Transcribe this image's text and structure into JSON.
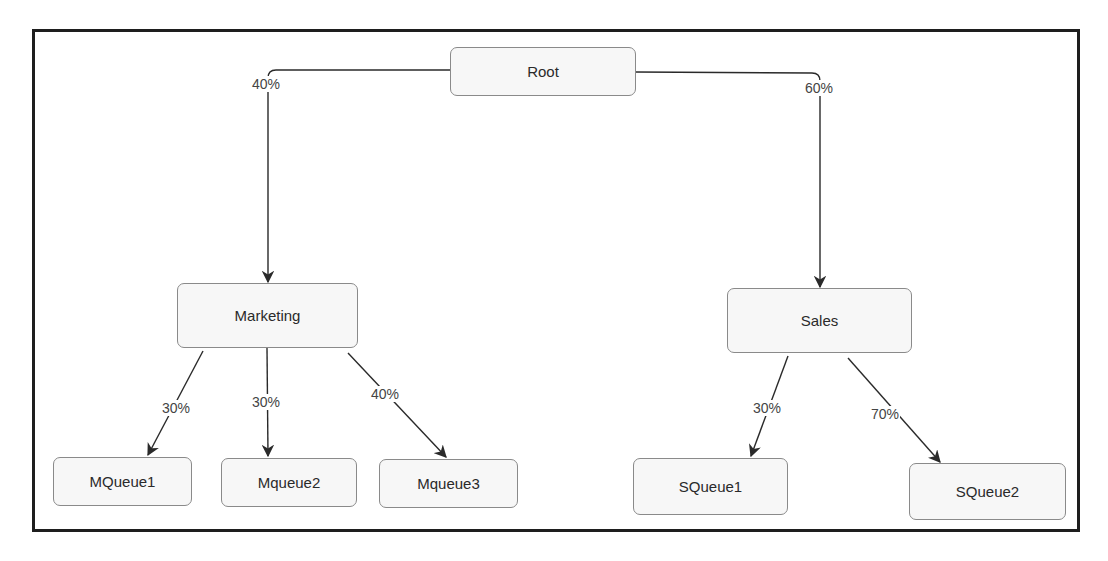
{
  "diagram": {
    "type": "tree",
    "title": "",
    "nodes": {
      "root": {
        "label": "Root"
      },
      "marketing": {
        "label": "Marketing"
      },
      "sales": {
        "label": "Sales"
      },
      "mqueue1": {
        "label": "MQueue1"
      },
      "mqueue2": {
        "label": "Mqueue2"
      },
      "mqueue3": {
        "label": "Mqueue3"
      },
      "squeue1": {
        "label": "SQueue1"
      },
      "squeue2": {
        "label": "SQueue2"
      }
    },
    "edges": {
      "root_marketing": {
        "from": "Root",
        "to": "Marketing",
        "label": "40%"
      },
      "root_sales": {
        "from": "Root",
        "to": "Sales",
        "label": "60%"
      },
      "marketing_mqueue1": {
        "from": "Marketing",
        "to": "MQueue1",
        "label": "30%"
      },
      "marketing_mqueue2": {
        "from": "Marketing",
        "to": "Mqueue2",
        "label": "30%"
      },
      "marketing_mqueue3": {
        "from": "Marketing",
        "to": "Mqueue3",
        "label": "40%"
      },
      "sales_squeue1": {
        "from": "Sales",
        "to": "SQueue1",
        "label": "30%"
      },
      "sales_squeue2": {
        "from": "Sales",
        "to": "SQueue2",
        "label": "70%"
      }
    },
    "colors": {
      "frame": "#1e1e1e",
      "node_fill": "#f7f7f7",
      "node_border": "#8a8a8a",
      "edge": "#2a2a2a",
      "text": "#2a2a2a"
    }
  }
}
